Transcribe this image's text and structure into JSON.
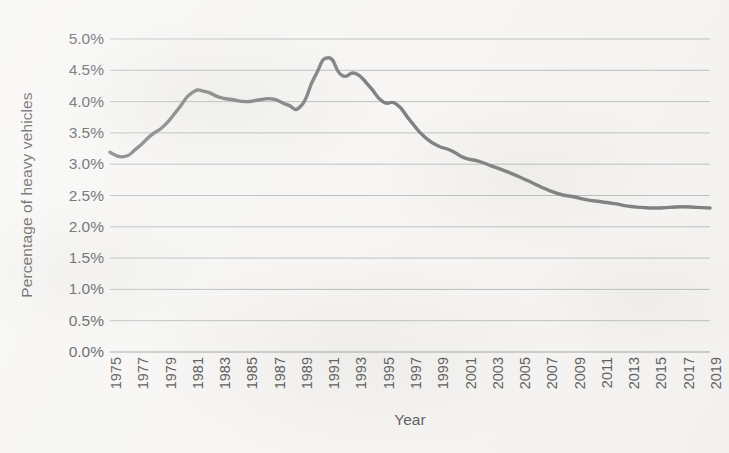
{
  "chart_data": {
    "type": "line",
    "title": "",
    "xlabel": "Year",
    "ylabel": "Percentage of heavy vehicles",
    "xlim": [
      1975,
      2019
    ],
    "ylim": [
      0.0,
      5.0
    ],
    "ytick_values": [
      0.0,
      0.5,
      1.0,
      1.5,
      2.0,
      2.5,
      3.0,
      3.5,
      4.0,
      4.5,
      5.0
    ],
    "ytick_labels": [
      "0.0%",
      "0.5%",
      "1.0%",
      "1.5%",
      "2.0%",
      "2.5%",
      "3.0%",
      "3.5%",
      "4.0%",
      "4.5%",
      "5.0%"
    ],
    "xtick_labels": [
      "1975",
      "1977",
      "1979",
      "1981",
      "1983",
      "1985",
      "1987",
      "1989",
      "1991",
      "1993",
      "1995",
      "1997",
      "1999",
      "2001",
      "2003",
      "2005",
      "2007",
      "2009",
      "2011",
      "2013",
      "2015",
      "2017",
      "2019"
    ],
    "xtick_values": [
      1975,
      1977,
      1979,
      1981,
      1983,
      1985,
      1987,
      1989,
      1991,
      1993,
      1995,
      1997,
      1999,
      2001,
      2003,
      2005,
      2007,
      2009,
      2011,
      2013,
      2015,
      2017,
      2019
    ],
    "grid": "horizontal",
    "legend": "none",
    "line_color": "#808080",
    "line_width": 3.4,
    "x": [
      1975,
      1976,
      1977,
      1978,
      1979,
      1980,
      1981,
      1982,
      1983,
      1984,
      1985,
      1986,
      1987,
      1988,
      1989,
      1990,
      1991,
      1992,
      1993,
      1994,
      1995,
      1996,
      1997,
      1998,
      1999,
      2000,
      2001,
      2002,
      2003,
      2004,
      2005,
      2006,
      2007,
      2008,
      2009,
      2010,
      2011,
      2012,
      2013,
      2014,
      2015,
      2016,
      2017,
      2018,
      2019
    ],
    "y": [
      3.19,
      3.12,
      3.26,
      3.46,
      3.62,
      3.88,
      4.14,
      4.16,
      4.07,
      4.03,
      4.0,
      4.03,
      4.04,
      3.95,
      3.93,
      4.39,
      4.7,
      4.42,
      4.45,
      4.25,
      4.0,
      3.96,
      3.7,
      3.45,
      3.3,
      3.22,
      3.1,
      3.05,
      2.97,
      2.89,
      2.8,
      2.7,
      2.6,
      2.52,
      2.48,
      2.43,
      2.4,
      2.37,
      2.33,
      2.31,
      2.3,
      2.31,
      2.32,
      2.31,
      2.3
    ],
    "series": [
      {
        "name": "Percentage of heavy vehicles",
        "values": [
          3.19,
          3.12,
          3.26,
          3.46,
          3.62,
          3.88,
          4.14,
          4.16,
          4.07,
          4.03,
          4.0,
          4.03,
          4.04,
          3.95,
          3.93,
          4.39,
          4.7,
          4.42,
          4.45,
          4.25,
          4.0,
          3.96,
          3.7,
          3.45,
          3.3,
          3.22,
          3.1,
          3.05,
          2.97,
          2.89,
          2.8,
          2.7,
          2.6,
          2.52,
          2.48,
          2.43,
          2.4,
          2.37,
          2.33,
          2.31,
          2.3,
          2.31,
          2.32,
          2.31,
          2.3
        ]
      }
    ]
  },
  "style": {
    "background_color": "#f7f6f4",
    "grid_color": "#bfbfbf",
    "text_color": "#5d5d5d",
    "line_color": "#808080"
  }
}
